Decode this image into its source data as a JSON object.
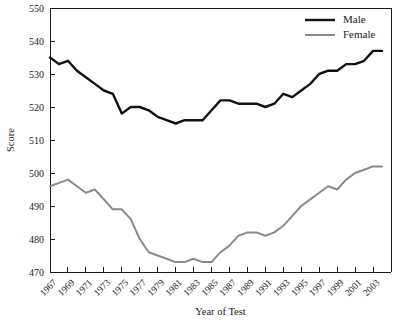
{
  "chart_data": {
    "type": "line",
    "title": "",
    "xlabel": "Year of Test",
    "ylabel": "Score",
    "xlim": [
      1967,
      2005
    ],
    "ylim": [
      470,
      550
    ],
    "ytick_step": 10,
    "xtick_step": 2,
    "grid": false,
    "legend_position": "top-right",
    "yticks": [
      470,
      480,
      490,
      500,
      510,
      520,
      530,
      540,
      550
    ],
    "xticks": [
      1967,
      1969,
      1971,
      1973,
      1975,
      1977,
      1979,
      1981,
      1983,
      1985,
      1987,
      1989,
      1991,
      1993,
      1995,
      1997,
      1999,
      2001,
      2003
    ],
    "xtick_labels": [
      "1967",
      "1969",
      "1971",
      "1973",
      "1975",
      "1977",
      "1979",
      "1981",
      "1983",
      "1985",
      "1987",
      "1989",
      "1991",
      "1993",
      "1995",
      "1997",
      "1999",
      "2001",
      "2003"
    ],
    "x": [
      1967,
      1968,
      1969,
      1970,
      1971,
      1972,
      1973,
      1974,
      1975,
      1976,
      1977,
      1978,
      1979,
      1980,
      1981,
      1982,
      1983,
      1984,
      1985,
      1986,
      1987,
      1988,
      1989,
      1990,
      1991,
      1992,
      1993,
      1994,
      1995,
      1996,
      1997,
      1998,
      1999,
      2000,
      2001,
      2002,
      2003,
      2004
    ],
    "series": [
      {
        "name": "Male",
        "color": "#111111",
        "width": 2.4,
        "values": [
          535,
          533,
          534,
          531,
          529,
          527,
          525,
          524,
          518,
          520,
          520,
          519,
          517,
          516,
          515,
          516,
          516,
          516,
          519,
          522,
          522,
          521,
          521,
          521,
          520,
          521,
          524,
          523,
          525,
          527,
          530,
          531,
          531,
          533,
          533,
          534,
          537,
          537
        ]
      },
      {
        "name": "Female",
        "color": "#8a8a8a",
        "width": 2.0,
        "values": [
          496,
          497,
          498,
          496,
          494,
          495,
          492,
          489,
          489,
          486,
          480,
          476,
          475,
          474,
          473,
          473,
          474,
          473,
          473,
          476,
          478,
          481,
          482,
          482,
          481,
          482,
          484,
          487,
          490,
          492,
          494,
          496,
          495,
          498,
          500,
          501,
          502,
          502
        ]
      }
    ]
  },
  "legend": {
    "entries": [
      {
        "label": "Male"
      },
      {
        "label": "Female"
      }
    ]
  },
  "axes": {
    "y_title": "Score",
    "x_title": "Year of Test"
  }
}
